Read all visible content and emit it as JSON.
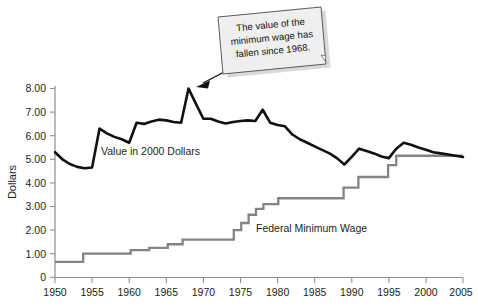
{
  "chart_data": {
    "type": "line",
    "title": "",
    "subtitle": "",
    "xlabel": "",
    "ylabel": "Dollars",
    "xlim": [
      1950,
      2005
    ],
    "ylim": [
      0,
      8
    ],
    "grid": false,
    "legend_position": "inline-labels",
    "x_ticks": [
      "1950",
      "1955",
      "1960",
      "1965",
      "1970",
      "1975",
      "1980",
      "1985",
      "1990",
      "1995",
      "2000",
      "2005"
    ],
    "x_tick_values": [
      1950,
      1955,
      1960,
      1965,
      1970,
      1975,
      1980,
      1985,
      1990,
      1995,
      2000,
      2005
    ],
    "y_ticks": [
      "0",
      "1.00",
      "2.00",
      "3.00",
      "4.00",
      "5.00",
      "6.00",
      "7.00",
      "8.00"
    ],
    "y_tick_values": [
      0,
      1,
      2,
      3,
      4,
      5,
      6,
      7,
      8
    ],
    "annotations": [
      {
        "name": "callout-note",
        "text": "The value of the minimum wage has fallen since 1968.",
        "lines": [
          "The value of the",
          "minimum wage has",
          "fallen since 1968."
        ],
        "points_to_year": 1968,
        "points_to_value": 8.0
      }
    ],
    "series": [
      {
        "name": "Value in 2000 Dollars",
        "label": "Value in 2000 Dollars",
        "color": "#111111",
        "style": "line",
        "x": [
          1950,
          1951,
          1952,
          1953,
          1954,
          1955,
          1956,
          1957,
          1958,
          1959,
          1960,
          1961,
          1962,
          1963,
          1964,
          1965,
          1966,
          1967,
          1968,
          1969,
          1970,
          1971,
          1972,
          1973,
          1974,
          1975,
          1976,
          1977,
          1978,
          1979,
          1980,
          1981,
          1982,
          1983,
          1984,
          1985,
          1986,
          1987,
          1988,
          1989,
          1990,
          1991,
          1992,
          1993,
          1994,
          1995,
          1996,
          1997,
          1998,
          1999,
          2000,
          2001,
          2002,
          2003,
          2004,
          2005
        ],
        "values": [
          5.3,
          5.0,
          4.8,
          4.68,
          4.62,
          4.65,
          6.3,
          6.1,
          5.95,
          5.85,
          5.7,
          6.55,
          6.5,
          6.6,
          6.68,
          6.65,
          6.58,
          6.55,
          8.0,
          7.35,
          6.72,
          6.72,
          6.6,
          6.52,
          6.58,
          6.62,
          6.65,
          6.62,
          7.1,
          6.55,
          6.45,
          6.4,
          6.05,
          5.85,
          5.7,
          5.55,
          5.4,
          5.25,
          5.05,
          4.78,
          5.1,
          5.45,
          5.35,
          5.25,
          5.12,
          5.05,
          5.45,
          5.7,
          5.62,
          5.5,
          5.4,
          5.3,
          5.25,
          5.2,
          5.15,
          5.1
        ]
      },
      {
        "name": "Federal Minimum Wage",
        "label": "Federal Minimum Wage",
        "color": "#848484",
        "style": "step",
        "x": [
          1950,
          1954,
          1955,
          1956,
          1961,
          1963,
          1967,
          1968,
          1974,
          1975,
          1976,
          1978,
          1979,
          1980,
          1981,
          1990,
          1991,
          1996,
          1997,
          2005
        ],
        "values": [
          0.65,
          0.65,
          1.0,
          1.0,
          1.0,
          1.15,
          1.25,
          1.4,
          1.6,
          2.0,
          2.1,
          2.3,
          2.65,
          2.9,
          3.1,
          3.35,
          3.8,
          4.25,
          4.75,
          5.15
        ],
        "steps": [
          {
            "year_start": 1950,
            "year_end": 1953.8,
            "value": 0.65
          },
          {
            "year_start": 1953.8,
            "year_end": 1960.2,
            "value": 1.0
          },
          {
            "year_start": 1960.2,
            "year_end": 1962.7,
            "value": 1.15
          },
          {
            "year_start": 1962.7,
            "year_end": 1965.2,
            "value": 1.25
          },
          {
            "year_start": 1965.2,
            "year_end": 1967.2,
            "value": 1.4
          },
          {
            "year_start": 1967.2,
            "year_end": 1968.8,
            "value": 1.6
          },
          {
            "year_start": 1968.8,
            "year_end": 1974.1,
            "value": 1.6
          },
          {
            "year_start": 1974.1,
            "year_end": 1975.1,
            "value": 2.0
          },
          {
            "year_start": 1975.1,
            "year_end": 1976.1,
            "value": 2.3
          },
          {
            "year_start": 1976.1,
            "year_end": 1977.1,
            "value": 2.65
          },
          {
            "year_start": 1977.1,
            "year_end": 1978.1,
            "value": 2.9
          },
          {
            "year_start": 1978.1,
            "year_end": 1980.1,
            "value": 3.1
          },
          {
            "year_start": 1980.1,
            "year_end": 1988.9,
            "value": 3.35
          },
          {
            "year_start": 1988.9,
            "year_end": 1990.9,
            "value": 3.8
          },
          {
            "year_start": 1990.9,
            "year_end": 1994.9,
            "value": 4.25
          },
          {
            "year_start": 1994.9,
            "year_end": 1996.0,
            "value": 4.75
          },
          {
            "year_start": 1996.0,
            "year_end": 2005,
            "value": 5.15
          }
        ]
      }
    ]
  },
  "axes": {
    "y_title": "Dollars",
    "axis_color": "#8e8e8e"
  },
  "colors": {
    "real_value_line": "#111111",
    "minimum_wage_line": "#848484",
    "axis": "#8e8e8e",
    "callout_fill": "#efefef",
    "callout_border": "#5a5a5a",
    "text": "#1d1d1d",
    "background": "#ffffff"
  }
}
